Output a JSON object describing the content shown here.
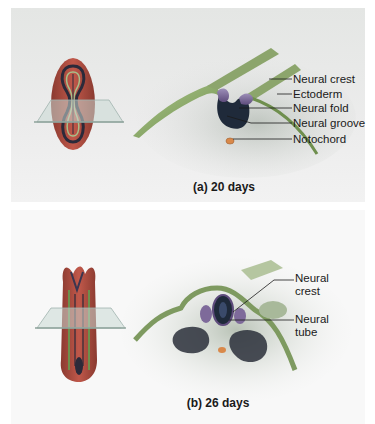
{
  "figure": {
    "panels": [
      {
        "id": "a",
        "caption": "(a) 20 days",
        "labels": [
          "Neural crest",
          "Ectoderm",
          "Neural fold",
          "Neural groove",
          "Notochord"
        ]
      },
      {
        "id": "b",
        "caption": "(b) 26 days",
        "labels": [
          "Neural\ncrest",
          "Neural\ntube"
        ],
        "labels_lines": [
          [
            "Neural",
            "crest"
          ],
          [
            "Neural",
            "tube"
          ]
        ]
      }
    ]
  },
  "colors": {
    "ectoderm_green": "#8fae6a",
    "neural_fold_purple": "#6e5a8c",
    "neural_groove_dark": "#1f2a3a",
    "notochord_orange": "#d9894a",
    "embryo_red": "#b24a3a",
    "embryo_green": "#6d8f4c",
    "somite_dark": "#2a2f3a",
    "plane_glass": "#c9d9d4"
  }
}
